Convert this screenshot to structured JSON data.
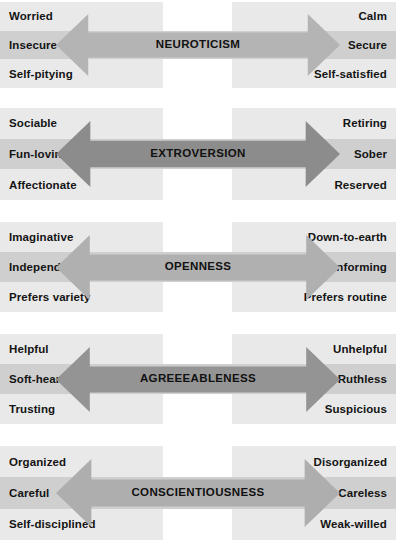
{
  "figure": {
    "name": "big-five-personality-factors",
    "background": "#ffffff",
    "band_light": "#e9e9e9",
    "band_mid": "#cfcfcf",
    "text_color": "#141414"
  },
  "panels": [
    {
      "id": "neuroticism",
      "title": "NEUROTICISM",
      "arrow_color": "#b4b4b4",
      "top": 2,
      "height": 86,
      "left_traits": [
        "Worried",
        "Insecure",
        "Self-pitying"
      ],
      "right_traits": [
        "Calm",
        "Secure",
        "Self-satisfied"
      ]
    },
    {
      "id": "extroversion",
      "title": "EXTROVERSION",
      "arrow_color": "#8c8c8c",
      "top": 108,
      "height": 92,
      "left_traits": [
        "Sociable",
        "Fun-loving",
        "Affectionate"
      ],
      "right_traits": [
        "Retiring",
        "Sober",
        "Reserved"
      ]
    },
    {
      "id": "openness",
      "title": "OPENNESS",
      "arrow_color": "#b0b0b0",
      "top": 222,
      "height": 90,
      "left_traits": [
        "Imaginative",
        "Independent",
        "Prefers variety"
      ],
      "right_traits": [
        "Down-to-earth",
        "Conforming",
        "Prefers routine"
      ]
    },
    {
      "id": "agreeableness",
      "title": "AGREEEABLENESS",
      "arrow_color": "#949494",
      "top": 334,
      "height": 90,
      "left_traits": [
        "Helpful",
        "Soft-hearted",
        "Trusting"
      ],
      "right_traits": [
        "Unhelpful",
        "Ruthless",
        "Suspicious"
      ]
    },
    {
      "id": "conscientiousness",
      "title": "CONSCIENTIOUSNESS",
      "arrow_color": "#aeaeae",
      "top": 446,
      "height": 94,
      "left_traits": [
        "Organized",
        "Careful",
        "Self-disciplined"
      ],
      "right_traits": [
        "Disorganized",
        "Careless",
        "Weak-willed"
      ]
    }
  ]
}
